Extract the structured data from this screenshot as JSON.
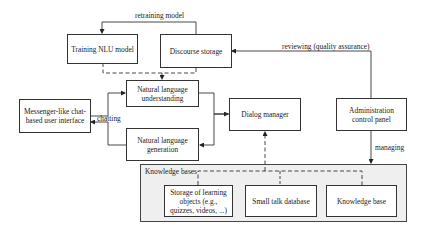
{
  "diagram": {
    "nodes": {
      "training_nlu": "Training NLU model",
      "discourse_storage": "Discourse storage",
      "nlu": "Natural language understanding",
      "nlg": "Natural language generation",
      "messenger_ui": "Messenger-like chat-based user interface",
      "dialog_manager": "Dialog manager",
      "admin_panel": "Administration control panel",
      "storage_learning": "Storage of learning objects (e.g., quizzes, videos, ...)",
      "small_talk_db": "Small talk database",
      "knowledge_base": "Knowledge base"
    },
    "containers": {
      "knowledge_bases": "Knowledge bases"
    },
    "edge_labels": {
      "retraining": "retraining model",
      "reviewing": "reviewing (quality assurance)",
      "chatting": "chatting",
      "managing": "managing"
    },
    "edges": [
      {
        "from": "discourse_storage",
        "to": "training_nlu",
        "label": "retraining model",
        "style": "solid"
      },
      {
        "from": "training_nlu",
        "to": "nlu",
        "style": "dashed"
      },
      {
        "from": "discourse_storage",
        "to": "nlu",
        "style": "dashed"
      },
      {
        "from": "messenger_ui",
        "to": "nlu",
        "style": "solid"
      },
      {
        "from": "nlg",
        "to": "messenger_ui",
        "label": "chatting",
        "style": "solid"
      },
      {
        "from": "nlu",
        "to": "dialog_manager",
        "style": "solid"
      },
      {
        "from": "dialog_manager",
        "to": "nlg",
        "style": "solid"
      },
      {
        "from": "admin_panel",
        "to": "discourse_storage",
        "label": "reviewing (quality assurance)",
        "style": "solid"
      },
      {
        "from": "admin_panel",
        "to": "knowledge_bases",
        "label": "managing",
        "style": "solid"
      },
      {
        "from": "knowledge_bases",
        "to": "dialog_manager",
        "style": "dashed"
      }
    ]
  }
}
